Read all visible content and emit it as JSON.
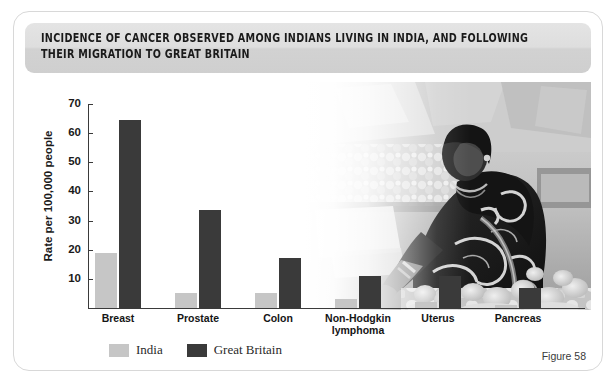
{
  "figure": {
    "title": "INCIDENCE OF CANCER OBSERVED AMONG INDIANS LIVING IN INDIA, AND FOLLOWING THEIR MIGRATION TO GREAT BRITAIN",
    "caption": "Figure 58",
    "photo_alt": "woman-at-vegetable-market-photo"
  },
  "colors": {
    "india_bar": "#c6c6c6",
    "great_britain_bar": "#3a3a3a",
    "banner": "#dedede",
    "axis": "#3a3a3a",
    "card_border": "#d8d8d8"
  },
  "chart_data": {
    "type": "bar",
    "title": "INCIDENCE OF CANCER OBSERVED AMONG INDIANS LIVING IN INDIA, AND FOLLOWING THEIR MIGRATION TO GREAT BRITAIN",
    "xlabel": "",
    "ylabel": "Rate per 100,000 people",
    "ylim": [
      0,
      70
    ],
    "yticks": [
      10,
      20,
      30,
      40,
      50,
      60,
      70
    ],
    "grid": false,
    "legend_position": "bottom-left",
    "categories": [
      "Breast",
      "Prostate",
      "Colon",
      "Non-Hodgkin lymphoma",
      "Uterus",
      "Pancreas"
    ],
    "series": [
      {
        "name": "India",
        "values": [
          19,
          5,
          5,
          3,
          2,
          1
        ]
      },
      {
        "name": "Great Britain",
        "values": [
          64.5,
          33.5,
          17,
          11,
          11,
          7
        ]
      }
    ]
  }
}
